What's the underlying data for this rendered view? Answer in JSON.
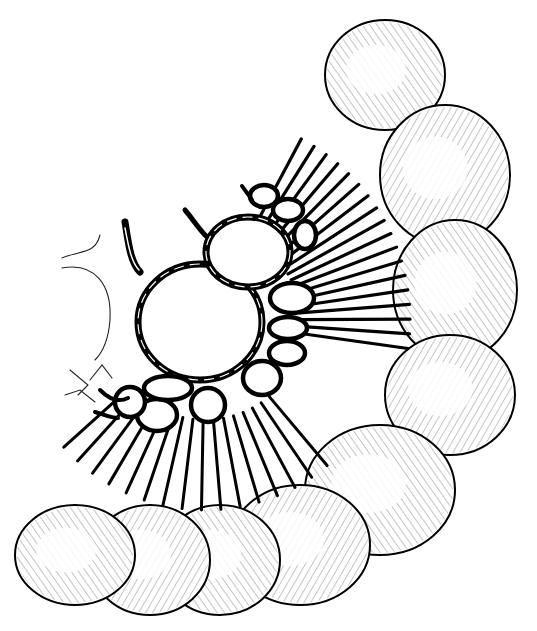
{
  "figure": {
    "type": "anatomical-line-drawing",
    "labels": [],
    "colors": {
      "ink": "#000000",
      "paper": "#ffffff"
    },
    "intestine": {
      "segments": [
        {
          "cx": 385,
          "cy": 75,
          "rx": 60,
          "ry": 55
        },
        {
          "cx": 445,
          "cy": 175,
          "rx": 65,
          "ry": 70
        },
        {
          "cx": 455,
          "cy": 290,
          "rx": 62,
          "ry": 70
        },
        {
          "cx": 450,
          "cy": 395,
          "rx": 65,
          "ry": 60
        },
        {
          "cx": 380,
          "cy": 490,
          "rx": 75,
          "ry": 65
        },
        {
          "cx": 300,
          "cy": 545,
          "rx": 70,
          "ry": 60
        },
        {
          "cx": 220,
          "cy": 560,
          "rx": 60,
          "ry": 55
        },
        {
          "cx": 150,
          "cy": 560,
          "rx": 60,
          "ry": 55
        },
        {
          "cx": 75,
          "cy": 555,
          "rx": 60,
          "ry": 50
        }
      ]
    },
    "arcades": {
      "primary_loops": [
        {
          "name": "large-central-loop",
          "cx": 200,
          "cy": 322,
          "rx": 62,
          "ry": 58
        },
        {
          "name": "upper-loop",
          "cx": 248,
          "cy": 252,
          "rx": 42,
          "ry": 35
        }
      ],
      "secondary_loops": [
        {
          "cx": 264,
          "cy": 196,
          "rx": 14,
          "ry": 11
        },
        {
          "cx": 288,
          "cy": 210,
          "rx": 15,
          "ry": 11
        },
        {
          "cx": 305,
          "cy": 235,
          "rx": 11,
          "ry": 14
        },
        {
          "cx": 292,
          "cy": 298,
          "rx": 22,
          "ry": 15
        },
        {
          "cx": 288,
          "cy": 328,
          "rx": 19,
          "ry": 11
        },
        {
          "cx": 287,
          "cy": 353,
          "rx": 18,
          "ry": 12
        },
        {
          "cx": 262,
          "cy": 378,
          "rx": 19,
          "ry": 17
        },
        {
          "cx": 208,
          "cy": 405,
          "rx": 17,
          "ry": 17
        },
        {
          "cx": 157,
          "cy": 415,
          "rx": 20,
          "ry": 16
        },
        {
          "cx": 130,
          "cy": 402,
          "rx": 15,
          "ry": 15
        },
        {
          "cx": 168,
          "cy": 388,
          "rx": 24,
          "ry": 12
        }
      ]
    },
    "vasa_recta": {
      "right_fan_count": 18,
      "bottom_fan_count": 16
    },
    "faint_outline_left": true
  }
}
